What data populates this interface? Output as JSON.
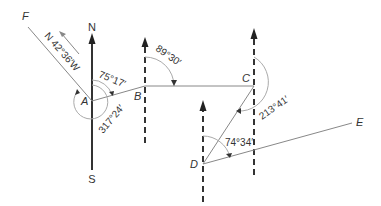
{
  "diagram": {
    "points": {
      "A": "A",
      "B": "B",
      "C": "C",
      "D": "D",
      "E": "E",
      "F": "F"
    },
    "compass": {
      "north": "N",
      "south": "S"
    },
    "bearings": {
      "AF": "N 42°36′W",
      "AB": "75°17′",
      "A_reflex": "317°24′",
      "BC": "89°30′",
      "CD": "213°41′",
      "DE": "74°34′"
    },
    "colors": {
      "line": "#555555",
      "arc": "#aaaaaa",
      "text": "#333333"
    }
  }
}
